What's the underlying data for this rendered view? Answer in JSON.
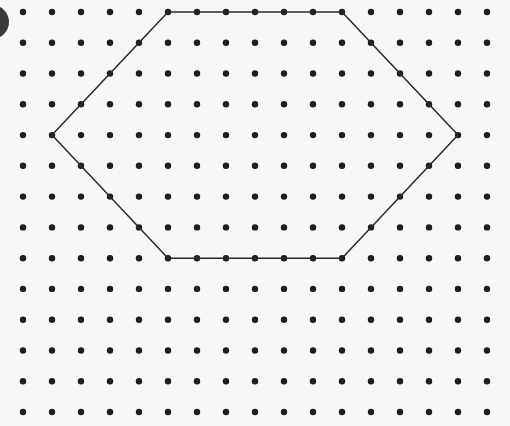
{
  "diagram": {
    "type": "dot-grid-with-hexagon",
    "grid": {
      "columns": 17,
      "rows": 14,
      "x_start": 23,
      "x_spacing": 29.0,
      "y_start": 12,
      "y_spacing": 30.77,
      "dot_radius": 3.2,
      "dot_color": "#1e1e1e"
    },
    "hexagon": {
      "vertices_grid": [
        [
          5,
          0
        ],
        [
          11,
          0
        ],
        [
          15,
          4
        ],
        [
          11,
          8
        ],
        [
          5,
          8
        ],
        [
          1,
          4
        ]
      ],
      "stroke_color": "#2a2a2a",
      "stroke_width": 1.5
    },
    "corner_marker": {
      "cx": -8,
      "cy": 22,
      "r": 17,
      "color": "#3a3a3a"
    },
    "background_color": "#f7f7f5"
  }
}
